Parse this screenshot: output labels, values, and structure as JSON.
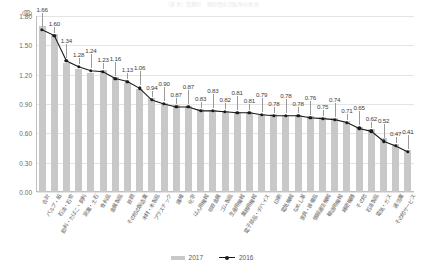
{
  "title": "（参考）業種別　棚卸資産回転率の推移",
  "axis": {
    "y_unit": "(回)",
    "y_ticks": [
      "0.00",
      "0.30",
      "0.60",
      "0.90",
      "1.20",
      "1.50",
      "1.80"
    ],
    "y_min": 0,
    "y_max": 1.8
  },
  "legend": {
    "items": [
      {
        "label": "2017",
        "marker": "bar-swatch",
        "color": "#c8c8c8"
      },
      {
        "label": "2016",
        "marker": "line-marker",
        "color": "#1a1a1a"
      }
    ]
  },
  "chart_data": {
    "type": "bar",
    "title": "（参考）業種別　棚卸資産回転率の推移",
    "xlabel": "",
    "ylabel": "(回)",
    "ylim": [
      0,
      1.8
    ],
    "ytick_step": 0.3,
    "grid": true,
    "legend_position": "bottom-center",
    "categories": [
      "合計",
      "パルプ・紙",
      "石油・石炭",
      "飲料・たばこ・飼料",
      "窯業・土石",
      "食料品",
      "金属製品",
      "鉄鋼",
      "その他の製造業",
      "木材・木製品",
      "プラスチック",
      "繊維",
      "化学",
      "はん用機械",
      "非鉄金属",
      "ゴム製品",
      "生産用機械",
      "業務用機械",
      "電子部品・デバイス",
      "印刷",
      "電気機械",
      "なめし革",
      "家具・装備品",
      "情報通信機械",
      "輸送用機械",
      "精密機器",
      "その他",
      "石油製品",
      "電気・ガス",
      "通信業",
      "その他サービス"
    ],
    "series": [
      {
        "name": "2017",
        "type": "bar",
        "color": "#c8c8c8",
        "values": [
          1.7,
          1.62,
          1.32,
          1.26,
          1.22,
          1.25,
          1.18,
          1.11,
          1.05,
          0.96,
          0.91,
          0.89,
          0.88,
          0.85,
          0.84,
          0.83,
          0.82,
          0.82,
          0.8,
          0.8,
          0.79,
          0.79,
          0.78,
          0.77,
          0.76,
          0.73,
          0.67,
          0.64,
          0.55,
          0.49,
          0.43
        ]
      },
      {
        "name": "2016",
        "type": "line",
        "color": "#1a1a1a",
        "values": [
          1.66,
          1.6,
          1.34,
          1.28,
          1.24,
          1.23,
          1.16,
          1.13,
          1.06,
          0.94,
          0.9,
          0.87,
          0.87,
          0.83,
          0.83,
          0.82,
          0.81,
          0.81,
          0.79,
          0.78,
          0.78,
          0.78,
          0.76,
          0.75,
          0.74,
          0.71,
          0.65,
          0.62,
          0.52,
          0.47,
          0.41
        ],
        "data_labels": [
          "1.66",
          "1.60",
          "1.34",
          "1.28",
          "1.24",
          "1.23",
          "1.16",
          "1.13",
          "1.06",
          "0.94",
          "0.90",
          "0.87",
          "0.87",
          "0.83",
          "0.83",
          "0.82",
          "0.81",
          "0.81",
          "0.79",
          "0.78",
          "0.78",
          "0.78",
          "0.76",
          "0.75",
          "0.74",
          "0.71",
          "0.65",
          "0.62",
          "0.52",
          "0.47",
          "0.41"
        ]
      }
    ]
  }
}
